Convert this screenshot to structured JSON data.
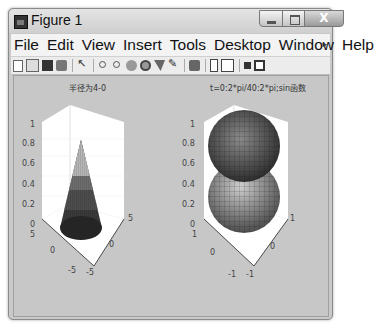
{
  "window": {
    "title": "Figure 1",
    "controls": [
      "minimize",
      "maximize",
      "close"
    ],
    "close_label": "X"
  },
  "menubar": {
    "items": [
      "File",
      "Edit",
      "View",
      "Insert",
      "Tools",
      "Desktop",
      "Window",
      "Help"
    ],
    "more_indicator": "▸"
  },
  "toolbar": {
    "icons": [
      "new-figure-icon",
      "open-file-icon",
      "save-icon",
      "print-icon",
      "edit-plot-arrow-icon",
      "zoom-in-icon",
      "zoom-out-icon",
      "pan-hand-icon",
      "rotate-3d-icon",
      "data-cursor-icon",
      "brush-icon",
      "link-plot-icon",
      "colorbar-icon",
      "legend-icon",
      "hide-plot-tools-icon",
      "show-plot-tools-icon"
    ]
  },
  "plots": [
    {
      "title": "半径为4-0",
      "type": "surface-cone",
      "z_ticks": [
        "1",
        "0.8",
        "0.6",
        "0.4",
        "0.2",
        "0"
      ],
      "x_ticks": [
        "5",
        "0",
        "-5"
      ],
      "y_ticks": [
        "-5",
        "0",
        "5"
      ]
    },
    {
      "title": "t=0:2*pi/40:2*pi;sin函数",
      "type": "surface-spheres",
      "z_ticks": [
        "1",
        "0.8",
        "0.6",
        "0.4",
        "0.2",
        "0"
      ],
      "x_ticks": [
        "1",
        "0",
        "-1"
      ],
      "y_ticks": [
        "-1",
        "0",
        "1"
      ]
    }
  ]
}
